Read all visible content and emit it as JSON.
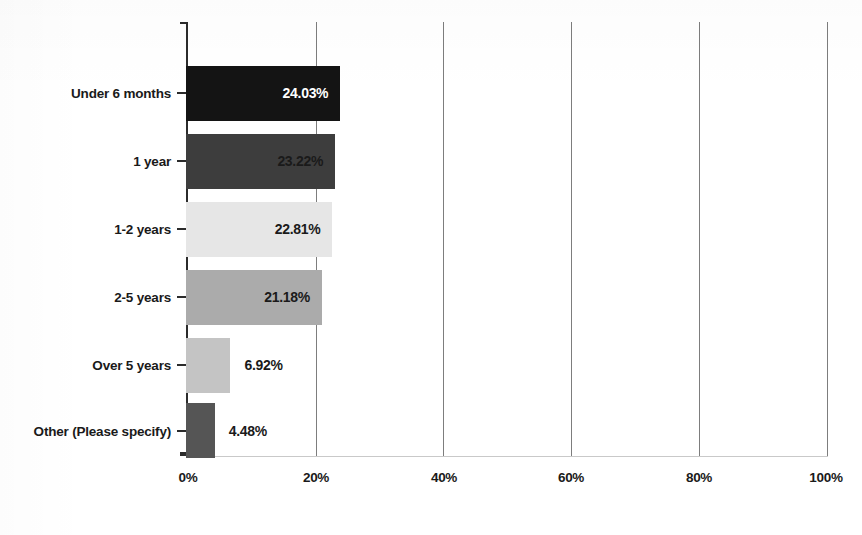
{
  "chart_data": {
    "type": "bar",
    "orientation": "horizontal",
    "title": "",
    "subtitle": "",
    "xlabel": "",
    "ylabel": "",
    "xlim": [
      0,
      100
    ],
    "grid": true,
    "legend": "none",
    "x_tick_labels": [
      "0%",
      "20%",
      "40%",
      "60%",
      "80%",
      "100%"
    ],
    "x_ticks": [
      0,
      20,
      40,
      60,
      80,
      100
    ],
    "categories": [
      "Under 6 months",
      "1 year",
      "1-2 years",
      "2-5 years",
      "Over 5 years",
      "Other (Please specify)"
    ],
    "values": [
      24.03,
      23.22,
      22.81,
      21.18,
      6.92,
      4.48
    ],
    "data_labels": [
      "24.03%",
      "23.22%",
      "22.81%",
      "21.18%",
      "6.92%",
      "4.48%"
    ],
    "bar_colors": [
      "#141414",
      "#3d3d3d",
      "#e6e6e6",
      "#ababab",
      "#c4c4c4",
      "#555555"
    ],
    "label_colors": [
      "#ffffff",
      "#1a1a1a",
      "#1a1a1a",
      "#1a1a1a",
      "#1a1a1a",
      "#1a1a1a"
    ],
    "label_placement": [
      "inside",
      "inside",
      "inside",
      "inside",
      "outside",
      "outside"
    ]
  },
  "axis": {
    "spine_color": "#2b2b2b",
    "gridline_color": "#7d7d7d",
    "baseline_color": "#c9c9c9"
  }
}
